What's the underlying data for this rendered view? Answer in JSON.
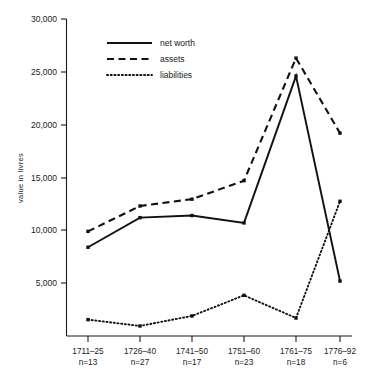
{
  "chart_data": {
    "type": "line",
    "title": "",
    "xlabel": "",
    "ylabel": "value in livres",
    "ylim": [
      0,
      30000
    ],
    "yticks": [
      0,
      5000,
      10000,
      15000,
      20000,
      25000,
      30000
    ],
    "ytick_labels": [
      "",
      "5,000",
      "10,000",
      "15,000",
      "20,000",
      "25,000",
      "30,000"
    ],
    "grid": false,
    "legend_position": "upper left",
    "categories": [
      "1711–25",
      "1726–40",
      "1741–50",
      "1751–60",
      "1761–75",
      "1776–92"
    ],
    "category_counts": [
      "n=13",
      "n=27",
      "n=17",
      "n=23",
      "n=18",
      "n=6"
    ],
    "series": [
      {
        "name": "net worth",
        "style": "solid",
        "values": [
          8400,
          11200,
          11400,
          10700,
          24600,
          5200
        ]
      },
      {
        "name": "assets",
        "style": "dashed",
        "values": [
          9900,
          12300,
          12950,
          14700,
          26300,
          19200
        ]
      },
      {
        "name": "liabilities",
        "style": "dotted",
        "values": [
          1550,
          950,
          1900,
          3850,
          1700,
          12750
        ]
      }
    ]
  },
  "axis": {
    "y_title": "value in livres",
    "y_tick_30000": "30,000",
    "y_tick_25000": "25,000",
    "y_tick_20000": "20,000",
    "y_tick_15000": "15,000",
    "y_tick_10000": "10,000",
    "y_tick_5000": "5,000"
  },
  "legend": {
    "items": [
      {
        "label": "net worth"
      },
      {
        "label": "assets"
      },
      {
        "label": "liabilities"
      }
    ]
  },
  "xaxis": {
    "categories": [
      {
        "period": "1711–25",
        "count": "n=13"
      },
      {
        "period": "1726–40",
        "count": "n=27"
      },
      {
        "period": "1741–50",
        "count": "n=17"
      },
      {
        "period": "1751–60",
        "count": "n=23"
      },
      {
        "period": "1761–75",
        "count": "n=18"
      },
      {
        "period": "1776–92",
        "count": "n=6"
      }
    ]
  },
  "colors": {
    "ink": "#111111",
    "background": "#ffffff"
  }
}
